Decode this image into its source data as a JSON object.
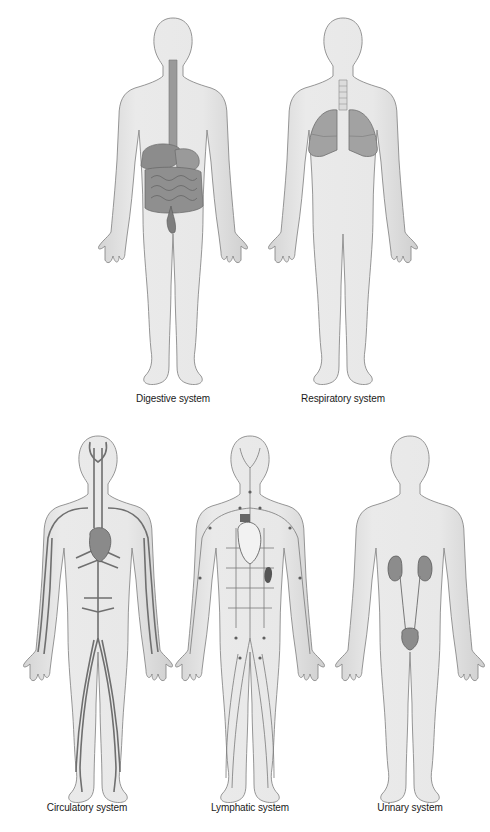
{
  "diagram": {
    "colors": {
      "skin": "#e6e6e6",
      "skin_outline": "#8a8a8a",
      "organ": "#8e8e8e",
      "vessel": "#6f6f6f",
      "lymph": "#777777",
      "label": "#1a1a1a"
    },
    "figures": [
      {
        "id": "digestive",
        "label": "Digestive system"
      },
      {
        "id": "respiratory",
        "label": "Respiratory system"
      },
      {
        "id": "circulatory",
        "label": "Circulatory system"
      },
      {
        "id": "lymphatic",
        "label": "Lymphatic system"
      },
      {
        "id": "urinary",
        "label": "Urinary system"
      }
    ]
  }
}
